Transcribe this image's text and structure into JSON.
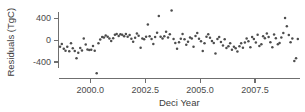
{
  "chart_data": {
    "type": "scatter",
    "title": "",
    "xlabel": "Deci Year",
    "ylabel": "Residuals (TgC)",
    "xlim": [
      1998.55,
      2009.55
    ],
    "ylim": [
      -700,
      620
    ],
    "grid": false,
    "legend": null,
    "xticks": [
      2000.0,
      2002.5,
      2005.0,
      2007.5
    ],
    "xticklabels": [
      "2000.0",
      "2002.5",
      "2005.0",
      "2007.5"
    ],
    "yticks": [
      400,
      0,
      -400
    ],
    "yticklabels": [
      "400",
      "0",
      "-400"
    ],
    "marker": "circle",
    "marker_color": "#4d4d4d",
    "axis_color": "#6f6f6f",
    "points": [
      {
        "x": 1998.62,
        "y": -120
      },
      {
        "x": 1998.7,
        "y": -70
      },
      {
        "x": 1998.79,
        "y": -160
      },
      {
        "x": 1998.87,
        "y": -195
      },
      {
        "x": 1998.95,
        "y": -120
      },
      {
        "x": 1999.04,
        "y": -205
      },
      {
        "x": 1999.12,
        "y": -60
      },
      {
        "x": 1999.2,
        "y": -150
      },
      {
        "x": 1999.29,
        "y": -200
      },
      {
        "x": 1999.37,
        "y": -330
      },
      {
        "x": 1999.45,
        "y": -230
      },
      {
        "x": 1999.54,
        "y": -145
      },
      {
        "x": 1999.62,
        "y": -190
      },
      {
        "x": 1999.7,
        "y": 30
      },
      {
        "x": 1999.79,
        "y": -80
      },
      {
        "x": 1999.87,
        "y": -170
      },
      {
        "x": 1999.95,
        "y": -180
      },
      {
        "x": 2000.04,
        "y": -175
      },
      {
        "x": 2000.12,
        "y": -110
      },
      {
        "x": 2000.2,
        "y": -195
      },
      {
        "x": 2000.29,
        "y": -605
      },
      {
        "x": 2000.37,
        "y": -60
      },
      {
        "x": 2000.45,
        "y": 10
      },
      {
        "x": 2000.54,
        "y": 55
      },
      {
        "x": 2000.62,
        "y": 45
      },
      {
        "x": 2000.7,
        "y": 85
      },
      {
        "x": 2000.79,
        "y": 60
      },
      {
        "x": 2000.87,
        "y": 30
      },
      {
        "x": 2000.95,
        "y": -15
      },
      {
        "x": 2001.04,
        "y": 35
      },
      {
        "x": 2001.12,
        "y": 95
      },
      {
        "x": 2001.2,
        "y": 110
      },
      {
        "x": 2001.29,
        "y": 75
      },
      {
        "x": 2001.37,
        "y": 105
      },
      {
        "x": 2001.45,
        "y": 95
      },
      {
        "x": 2001.54,
        "y": 70
      },
      {
        "x": 2001.62,
        "y": 110
      },
      {
        "x": 2001.7,
        "y": 60
      },
      {
        "x": 2001.79,
        "y": 90
      },
      {
        "x": 2001.87,
        "y": 25
      },
      {
        "x": 2001.95,
        "y": -30
      },
      {
        "x": 2002.04,
        "y": 40
      },
      {
        "x": 2002.12,
        "y": 120
      },
      {
        "x": 2002.2,
        "y": 80
      },
      {
        "x": 2002.29,
        "y": -140
      },
      {
        "x": 2002.37,
        "y": 30
      },
      {
        "x": 2002.45,
        "y": 15
      },
      {
        "x": 2002.54,
        "y": 60
      },
      {
        "x": 2002.62,
        "y": 285
      },
      {
        "x": 2002.7,
        "y": 70
      },
      {
        "x": 2002.79,
        "y": 20
      },
      {
        "x": 2002.87,
        "y": -70
      },
      {
        "x": 2002.95,
        "y": 55
      },
      {
        "x": 2003.04,
        "y": 135
      },
      {
        "x": 2003.12,
        "y": 440
      },
      {
        "x": 2003.2,
        "y": 60
      },
      {
        "x": 2003.29,
        "y": 30
      },
      {
        "x": 2003.37,
        "y": 70
      },
      {
        "x": 2003.45,
        "y": 150
      },
      {
        "x": 2003.54,
        "y": 45
      },
      {
        "x": 2003.62,
        "y": 105
      },
      {
        "x": 2003.7,
        "y": 540
      },
      {
        "x": 2003.79,
        "y": 20
      },
      {
        "x": 2003.87,
        "y": -55
      },
      {
        "x": 2003.95,
        "y": -160
      },
      {
        "x": 2004.04,
        "y": -40
      },
      {
        "x": 2004.12,
        "y": 25
      },
      {
        "x": 2004.2,
        "y": 110
      },
      {
        "x": 2004.29,
        "y": 15
      },
      {
        "x": 2004.37,
        "y": -85
      },
      {
        "x": 2004.45,
        "y": -30
      },
      {
        "x": 2004.54,
        "y": 45
      },
      {
        "x": 2004.62,
        "y": 30
      },
      {
        "x": 2004.7,
        "y": -120
      },
      {
        "x": 2004.79,
        "y": 75
      },
      {
        "x": 2004.87,
        "y": 130
      },
      {
        "x": 2004.95,
        "y": 25
      },
      {
        "x": 2005.04,
        "y": -20
      },
      {
        "x": 2005.12,
        "y": -200
      },
      {
        "x": 2005.2,
        "y": -60
      },
      {
        "x": 2005.29,
        "y": 60
      },
      {
        "x": 2005.37,
        "y": 105
      },
      {
        "x": 2005.45,
        "y": 40
      },
      {
        "x": 2005.54,
        "y": -15
      },
      {
        "x": 2005.62,
        "y": -55
      },
      {
        "x": 2005.7,
        "y": -245
      },
      {
        "x": 2005.79,
        "y": 20
      },
      {
        "x": 2005.87,
        "y": 55
      },
      {
        "x": 2005.95,
        "y": -35
      },
      {
        "x": 2006.04,
        "y": -100
      },
      {
        "x": 2006.12,
        "y": 15
      },
      {
        "x": 2006.2,
        "y": -145
      },
      {
        "x": 2006.29,
        "y": -115
      },
      {
        "x": 2006.37,
        "y": -60
      },
      {
        "x": 2006.45,
        "y": -175
      },
      {
        "x": 2006.54,
        "y": -120
      },
      {
        "x": 2006.62,
        "y": -150
      },
      {
        "x": 2006.7,
        "y": -210
      },
      {
        "x": 2006.79,
        "y": -115
      },
      {
        "x": 2006.87,
        "y": -60
      },
      {
        "x": 2006.95,
        "y": -140
      },
      {
        "x": 2007.04,
        "y": -45
      },
      {
        "x": 2007.12,
        "y": 30
      },
      {
        "x": 2007.2,
        "y": -20
      },
      {
        "x": 2007.29,
        "y": -130
      },
      {
        "x": 2007.37,
        "y": 55
      },
      {
        "x": 2007.45,
        "y": 20
      },
      {
        "x": 2007.54,
        "y": -45
      },
      {
        "x": 2007.62,
        "y": 95
      },
      {
        "x": 2007.7,
        "y": -110
      },
      {
        "x": 2007.79,
        "y": -75
      },
      {
        "x": 2007.87,
        "y": 70
      },
      {
        "x": 2007.95,
        "y": 35
      },
      {
        "x": 2008.04,
        "y": 120
      },
      {
        "x": 2008.12,
        "y": 55
      },
      {
        "x": 2008.2,
        "y": -40
      },
      {
        "x": 2008.29,
        "y": -130
      },
      {
        "x": 2008.37,
        "y": 100
      },
      {
        "x": 2008.45,
        "y": 35
      },
      {
        "x": 2008.54,
        "y": -75
      },
      {
        "x": 2008.62,
        "y": -55
      },
      {
        "x": 2008.7,
        "y": 45
      },
      {
        "x": 2008.79,
        "y": 130
      },
      {
        "x": 2008.87,
        "y": 400
      },
      {
        "x": 2008.95,
        "y": 250
      },
      {
        "x": 2009.04,
        "y": 90
      },
      {
        "x": 2009.12,
        "y": -40
      },
      {
        "x": 2009.2,
        "y": 30
      },
      {
        "x": 2009.29,
        "y": -380
      },
      {
        "x": 2009.37,
        "y": -330
      },
      {
        "x": 2009.45,
        "y": 20
      }
    ]
  }
}
